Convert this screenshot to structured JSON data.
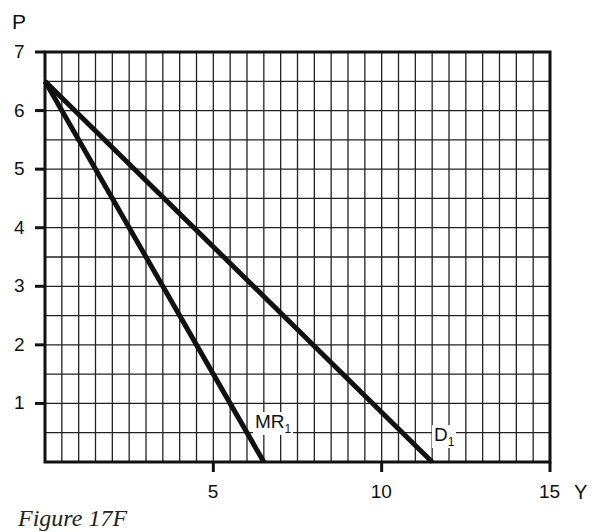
{
  "chart_data": {
    "type": "line",
    "title": "",
    "xlabel": "Y",
    "ylabel": "P",
    "xlim": [
      0,
      15
    ],
    "ylim": [
      0,
      7
    ],
    "grid": true,
    "grid_step_x": 0.5,
    "grid_step_y": 0.5,
    "x_ticks": [
      5,
      10,
      15
    ],
    "y_ticks": [
      1,
      2,
      3,
      4,
      5,
      6,
      7
    ],
    "series": [
      {
        "name": "D1",
        "label_main": "D",
        "label_sub": "1",
        "points": [
          [
            0,
            6.5
          ],
          [
            11.5,
            0
          ]
        ],
        "label_at": [
          12.0,
          0.35
        ]
      },
      {
        "name": "MR1",
        "label_main": "MR",
        "label_sub": "1",
        "points": [
          [
            0,
            6.5
          ],
          [
            6.5,
            0
          ]
        ],
        "label_at": [
          7.1,
          0.7
        ]
      }
    ],
    "caption": "Figure 17F"
  },
  "axes": {
    "x_label": "Y",
    "y_label": "P",
    "x_tick_labels": [
      "5",
      "10",
      "15"
    ],
    "y_tick_labels": [
      "1",
      "2",
      "3",
      "4",
      "5",
      "6",
      "7"
    ]
  },
  "legend": {
    "d1": {
      "main": "D",
      "sub": "1"
    },
    "mr1": {
      "main": "MR",
      "sub": "1"
    }
  },
  "caption": "Figure 17F",
  "colors": {
    "line": "#111111",
    "grid": "#222222",
    "background": "#ffffff"
  }
}
